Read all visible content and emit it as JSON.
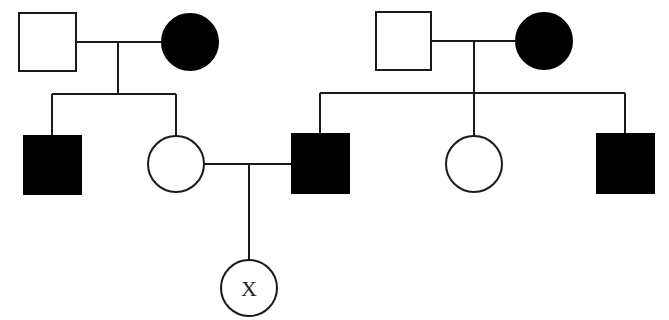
{
  "diagram": {
    "type": "pedigree",
    "colors": {
      "affected": "#000000",
      "unaffected": "#ffffff",
      "line": "#1a1a1a"
    },
    "legend_meaning": {
      "square": "male",
      "circle": "female",
      "filled": "affected",
      "open": "unaffected"
    },
    "generations": [
      {
        "id": "I",
        "families": [
          {
            "id": "I-left",
            "members": [
              {
                "id": "I-1",
                "sex": "male",
                "affected": false
              },
              {
                "id": "I-2",
                "sex": "female",
                "affected": true
              }
            ]
          },
          {
            "id": "I-right",
            "members": [
              {
                "id": "I-3",
                "sex": "male",
                "affected": false
              },
              {
                "id": "I-4",
                "sex": "female",
                "affected": true
              }
            ]
          }
        ]
      },
      {
        "id": "II",
        "members": [
          {
            "id": "II-1",
            "sex": "male",
            "affected": true,
            "parents": "I-left"
          },
          {
            "id": "II-2",
            "sex": "female",
            "affected": false,
            "parents": "I-left"
          },
          {
            "id": "II-3",
            "sex": "male",
            "affected": true,
            "parents": "I-right"
          },
          {
            "id": "II-4",
            "sex": "female",
            "affected": false,
            "parents": "I-right"
          },
          {
            "id": "II-5",
            "sex": "male",
            "affected": true,
            "parents": "I-right"
          }
        ],
        "matings": [
          {
            "partners": [
              "II-2",
              "II-3"
            ]
          }
        ]
      },
      {
        "id": "III",
        "members": [
          {
            "id": "III-1",
            "sex": "female",
            "affected": false,
            "parents": "II-2 x II-3",
            "label": "X"
          }
        ]
      }
    ]
  }
}
